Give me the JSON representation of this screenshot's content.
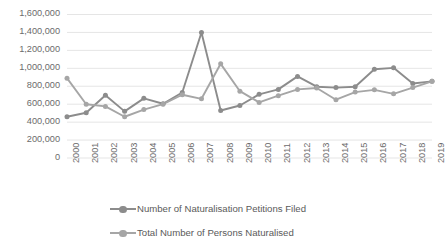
{
  "chart_data": {
    "type": "line",
    "title": "",
    "xlabel": "",
    "ylabel": "",
    "grid": true,
    "legend_position": "bottom",
    "ylim": [
      0,
      1600000
    ],
    "ytick_labels": [
      "1,600,000",
      "1,400,000",
      "1,200,000",
      "1,000,000",
      "800,000",
      "600,000",
      "400,000",
      "200,000",
      "0"
    ],
    "ytick_values": [
      1600000,
      1400000,
      1200000,
      1000000,
      800000,
      600000,
      400000,
      200000,
      0
    ],
    "categories": [
      "2000",
      "2001",
      "2002",
      "2003",
      "2004",
      "2005",
      "2006",
      "2007",
      "2008",
      "2009",
      "2010",
      "2011",
      "2012",
      "2013",
      "2014",
      "2015",
      "2016",
      "2017",
      "2018",
      "2019"
    ],
    "x": [
      2000,
      2001,
      2002,
      2003,
      2004,
      2005,
      2006,
      2007,
      2008,
      2009,
      2010,
      2011,
      2012,
      2013,
      2014,
      2015,
      2016,
      2017,
      2018,
      2019
    ],
    "series": [
      {
        "name": "Number of Naturalisation Petitions Filed",
        "color": "#8c8c8c",
        "values": [
          460000,
          505000,
          700000,
          520000,
          665000,
          605000,
          730000,
          1400000,
          530000,
          585000,
          710000,
          765000,
          910000,
          795000,
          785000,
          795000,
          990000,
          1005000,
          830000,
          855000
        ]
      },
      {
        "name": "Total Number of Persons Naturalised",
        "color": "#a6a6a6",
        "values": [
          890000,
          600000,
          575000,
          460000,
          540000,
          600000,
          705000,
          660000,
          1050000,
          745000,
          620000,
          695000,
          765000,
          780000,
          650000,
          735000,
          760000,
          715000,
          785000,
          855000
        ]
      }
    ]
  },
  "legend": {
    "items": [
      {
        "label": "Number of Naturalisation Petitions Filed"
      },
      {
        "label": "Total Number of Persons Naturalised"
      }
    ]
  },
  "colors": {
    "series1": "#8c8c8c",
    "series2": "#a6a6a6",
    "gridline": "#e2e2e2",
    "axis_text": "#6b6b6b",
    "background": "#ffffff"
  }
}
